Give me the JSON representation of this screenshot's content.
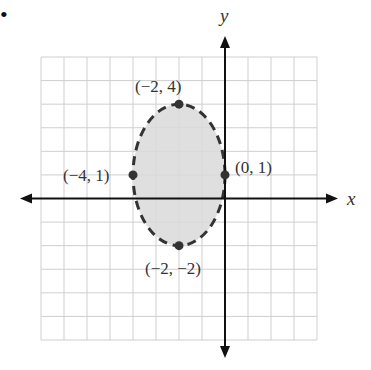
{
  "chart_data": {
    "type": "scatter",
    "title": "",
    "xlabel": "x",
    "ylabel": "y",
    "xlim": [
      -8,
      4
    ],
    "ylim": [
      -6,
      6
    ],
    "grid": true,
    "shape": {
      "kind": "ellipse",
      "center": [
        -2,
        1
      ],
      "semi_axis_x": 2,
      "semi_axis_y": 3,
      "boundary": "dashed",
      "filled": true,
      "fill_color": "#d9d9d9"
    },
    "points": [
      {
        "x": -2,
        "y": 4,
        "label": "(−2, 4)"
      },
      {
        "x": -4,
        "y": 1,
        "label": "(−4, 1)"
      },
      {
        "x": 0,
        "y": 1,
        "label": "(0, 1)"
      },
      {
        "x": -2,
        "y": -2,
        "label": "(−2, −2)"
      }
    ]
  },
  "bullet": "•",
  "colors": {
    "axis": "#111111",
    "grid": "#cfcfcf",
    "fill": "#d9d9d9",
    "curve": "#333333"
  }
}
